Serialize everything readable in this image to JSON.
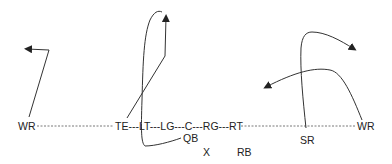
{
  "diagram": {
    "type": "football-play",
    "line_color": "#333333",
    "formation": {
      "line_text": "TE---LT---LG---C---RG---RT",
      "players": [
        {
          "id": "wr-left",
          "label": "WR",
          "x": 18,
          "y": 122
        },
        {
          "id": "te",
          "label": "TE",
          "x": 115,
          "y": 122
        },
        {
          "id": "lt",
          "label": "LT",
          "x": 139,
          "y": 122
        },
        {
          "id": "lg",
          "label": "LG",
          "x": 162,
          "y": 122
        },
        {
          "id": "c",
          "label": "C",
          "x": 186,
          "y": 122
        },
        {
          "id": "rg",
          "label": "RG",
          "x": 203,
          "y": 122
        },
        {
          "id": "rt",
          "label": "RT",
          "x": 228,
          "y": 122
        },
        {
          "id": "qb",
          "label": "QB",
          "x": 183,
          "y": 133
        },
        {
          "id": "x",
          "label": "X",
          "x": 203,
          "y": 147
        },
        {
          "id": "rb",
          "label": "RB",
          "x": 237,
          "y": 147
        },
        {
          "id": "sr",
          "label": "SR",
          "x": 300,
          "y": 135
        },
        {
          "id": "wr-right",
          "label": "WR",
          "x": 357,
          "y": 122
        }
      ]
    },
    "routes": [
      {
        "player": "wr-left",
        "path": "M29,117 L49,50 L27,49",
        "arrow_at": [
          25,
          49
        ],
        "arrow_dir": "left"
      },
      {
        "player": "te",
        "path": "M127,118 L165,56 L166,15",
        "arrow_at": [
          166,
          12
        ],
        "arrow_dir": "up"
      },
      {
        "player": "lt",
        "path": "M181,138 C170,142 155,146 145,146 C141,143 141,130 142,100 C143,60 144,35 150,20 C154,12 158,10 162,12",
        "arrow_at": null
      },
      {
        "player": "sr",
        "path": "M306,128 C303,100 300,70 301,48 C302,36 306,32 312,32 C325,32 340,40 355,49",
        "arrow_at": [
          358,
          51
        ],
        "arrow_dir": "right"
      },
      {
        "player": "wr-right",
        "path": "M362,120 C352,95 342,72 330,70 C315,67 295,72 265,88",
        "arrow_at": [
          262,
          89
        ],
        "arrow_dir": "left"
      }
    ]
  }
}
